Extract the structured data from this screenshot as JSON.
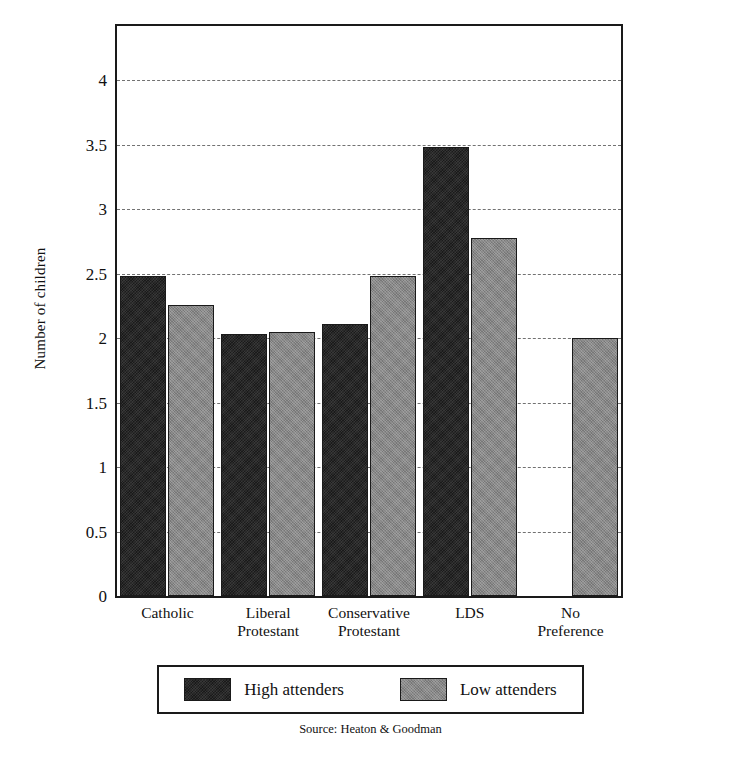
{
  "chart_data": {
    "type": "bar",
    "title": "",
    "xlabel": "",
    "ylabel": "Number of children",
    "ylim": [
      0,
      4.42
    ],
    "yticks": [
      0,
      0.5,
      1,
      1.5,
      2,
      2.5,
      3,
      3.5,
      4
    ],
    "ytick_labels": [
      "0",
      "0.5",
      "1",
      "1.5",
      "2",
      "2.5",
      "3",
      "3.5",
      "4"
    ],
    "grid": true,
    "grid_style": "dashed-horizontal",
    "legend_position": "below-axes",
    "categories": [
      "Catholic",
      "Liberal Protestant",
      "Conservative Protestant",
      "LDS",
      "No Preference"
    ],
    "category_label_lines": [
      [
        "Catholic"
      ],
      [
        "Liberal",
        "Protestant"
      ],
      [
        "Conservative",
        "Protestant"
      ],
      [
        "LDS"
      ],
      [
        "No",
        "Preference"
      ]
    ],
    "series": [
      {
        "name": "High attenders",
        "color": "#2b2b2b",
        "values": [
          2.48,
          2.03,
          2.11,
          3.48,
          null
        ]
      },
      {
        "name": "Low attenders",
        "color": "#878787",
        "values": [
          2.26,
          2.05,
          2.48,
          2.78,
          2.0
        ]
      }
    ],
    "annotations": {
      "source": "Source: Heaton & Goodman"
    }
  },
  "figure": {
    "background": "#ffffff",
    "frame_color": "#1a1a1a",
    "grid_color": "#5a5a5a"
  }
}
